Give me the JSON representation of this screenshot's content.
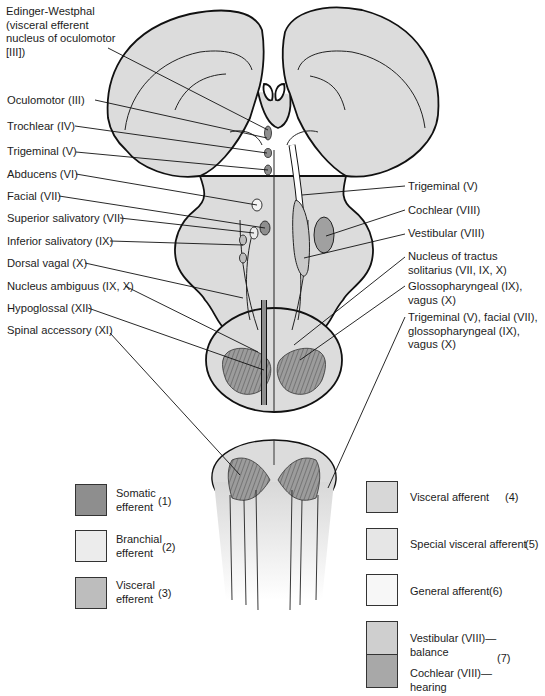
{
  "figure": {
    "left_labels": [
      {
        "text": "Edinger-Westphal\n(visceral efferent\nnucleus of oculomotor\n[III])",
        "x": 6,
        "y": 5
      },
      {
        "text": "Oculomotor (III)",
        "x": 7,
        "y": 94
      },
      {
        "text": "Trochlear (IV)",
        "x": 7,
        "y": 121
      },
      {
        "text": "Trigeminal (V)",
        "x": 7,
        "y": 146
      },
      {
        "text": "Abducens (VI)",
        "x": 7,
        "y": 169
      },
      {
        "text": "Facial (VII)",
        "x": 7,
        "y": 191
      },
      {
        "text": "Superior salivatory (VII)",
        "x": 7,
        "y": 213
      },
      {
        "text": "Inferior salivatory (IX)",
        "x": 7,
        "y": 236
      },
      {
        "text": "Dorsal vagal (X)",
        "x": 7,
        "y": 258
      },
      {
        "text": "Nucleus ambiguus (IX, X)",
        "x": 7,
        "y": 281
      },
      {
        "text": "Hypoglossal (XII)",
        "x": 7,
        "y": 303
      },
      {
        "text": "Spinal accessory (XI)",
        "x": 7,
        "y": 325
      }
    ],
    "right_labels": [
      {
        "text": "Trigeminal (V)",
        "x": 408,
        "y": 180
      },
      {
        "text": "Cochlear (VIII)",
        "x": 408,
        "y": 204
      },
      {
        "text": "Vestibular (VIII)",
        "x": 408,
        "y": 228
      },
      {
        "text": "Nucleus of tractus\nsolitarius (VII, IX, X)",
        "x": 408,
        "y": 251
      },
      {
        "text": "Glossopharyngeal (IX),\nvagus (X)",
        "x": 408,
        "y": 280
      },
      {
        "text": "Trigeminal (V), facial (VII),\nglossopharyngeal (IX),\nvagus (X)",
        "x": 408,
        "y": 311
      }
    ],
    "legend_left": [
      {
        "label": "Somatic\nefferent",
        "num": "(1)",
        "color": "#8e8e8e",
        "y": 484
      },
      {
        "label": "Branchial\nefferent",
        "num": "(2)",
        "color": "#ececec",
        "y": 530
      },
      {
        "label": "Visceral\nefferent",
        "num": "(3)",
        "color": "#bdbdbd",
        "y": 577
      }
    ],
    "legend_right": [
      {
        "label": "Visceral afferent",
        "num": "(4)",
        "color": "#d7d7d7",
        "y": 481
      },
      {
        "label": "Special visceral afferent",
        "num": "(5)",
        "color": "#e6e6e6",
        "y": 528
      },
      {
        "label": "General afferent",
        "num": "(6)",
        "color": "#f7f7f7",
        "y": 574
      }
    ],
    "legend_group": {
      "top_label": "Vestibular (VIII)—\nbalance",
      "top_color": "#cfcfcf",
      "bottom_label": "Cochlear (VIII)—\nhearing",
      "bottom_color": "#a8a8a8",
      "num": "(7)"
    },
    "colors": {
      "brainstem_fill": "#dcdcdc",
      "outline": "#111111",
      "somatic": "#8e8e8e",
      "hatch": "#7a7a7a"
    }
  }
}
